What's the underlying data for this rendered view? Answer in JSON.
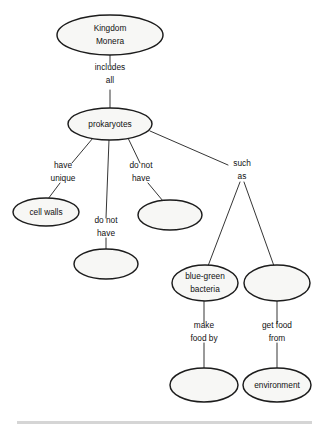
{
  "diagram": {
    "type": "concept-map",
    "background_color": "#ffffff",
    "node_fill_color": "#f7f7f5",
    "node_stroke_color": "#1c1c1c",
    "edge_color": "#2a2a2a",
    "nodes": [
      {
        "id": "kingdom-monera",
        "label": "Kingdom\nMonera",
        "line1": "Kingdom",
        "line2": "Monera",
        "blank": false,
        "cx": 110,
        "cy": 35,
        "rx": 53,
        "ry": 20
      },
      {
        "id": "prokaryotes",
        "label": "prokaryotes",
        "line1": "prokaryotes",
        "line2": "",
        "blank": false,
        "cx": 110,
        "cy": 124,
        "rx": 42,
        "ry": 16
      },
      {
        "id": "cell-walls",
        "label": "cell walls",
        "line1": "cell walls",
        "line2": "",
        "blank": false,
        "cx": 46,
        "cy": 212,
        "rx": 33,
        "ry": 14
      },
      {
        "id": "blank-do-not-have-1",
        "label": "",
        "line1": "",
        "line2": "",
        "blank": true,
        "cx": 170,
        "cy": 215,
        "rx": 32,
        "ry": 15
      },
      {
        "id": "blank-do-not-have-2",
        "label": "",
        "line1": "",
        "line2": "",
        "blank": true,
        "cx": 106,
        "cy": 264,
        "rx": 32,
        "ry": 15
      },
      {
        "id": "blue-green-bacteria",
        "label": "blue-green\nbacteria",
        "line1": "blue-green",
        "line2": "bacteria",
        "blank": false,
        "cx": 205,
        "cy": 283,
        "rx": 33,
        "ry": 18
      },
      {
        "id": "blank-such-as",
        "label": "",
        "line1": "",
        "line2": "",
        "blank": true,
        "cx": 277,
        "cy": 283,
        "rx": 33,
        "ry": 18
      },
      {
        "id": "blank-make-food-by",
        "label": "",
        "line1": "",
        "line2": "",
        "blank": true,
        "cx": 204,
        "cy": 385,
        "rx": 34,
        "ry": 17
      },
      {
        "id": "environment",
        "label": "environment",
        "line1": "environment",
        "line2": "",
        "blank": false,
        "cx": 277,
        "cy": 385,
        "rx": 34,
        "ry": 17
      }
    ],
    "link_labels": [
      {
        "id": "includes-all",
        "line1": "includes",
        "line2": "all",
        "x": 110,
        "y": 74
      },
      {
        "id": "have-unique",
        "line1": "have",
        "line2": "unique",
        "x": 63,
        "y": 172
      },
      {
        "id": "do-not-have-1",
        "line1": "do not",
        "line2": "have",
        "x": 141,
        "y": 172
      },
      {
        "id": "such-as",
        "line1": "such",
        "line2": "as",
        "x": 242,
        "y": 170
      },
      {
        "id": "do-not-have-2",
        "line1": "do not",
        "line2": "have",
        "x": 106,
        "y": 227
      },
      {
        "id": "make-food-by",
        "line1": "make",
        "line2": "food by",
        "x": 204,
        "y": 332
      },
      {
        "id": "get-food-from",
        "line1": "get food",
        "line2": "from",
        "x": 277,
        "y": 332
      }
    ],
    "edges": [
      {
        "id": "edge-monera-to-includes",
        "from": "kingdom-monera",
        "to": "includes-all",
        "x1": 110,
        "y1": 55,
        "x2": 110,
        "y2": 66
      },
      {
        "id": "edge-includes-to-prokaryotes",
        "from": "includes-all",
        "to": "prokaryotes",
        "x1": 110,
        "y1": 90,
        "x2": 110,
        "y2": 108
      },
      {
        "id": "edge-prokaryotes-to-have-unique",
        "from": "prokaryotes",
        "to": "have-unique",
        "x1": 93,
        "y1": 138,
        "x2": 72,
        "y2": 163
      },
      {
        "id": "edge-have-unique-to-cell-walls",
        "from": "have-unique",
        "to": "cell-walls",
        "x1": 60,
        "y1": 183,
        "x2": 48,
        "y2": 199
      },
      {
        "id": "edge-prokaryotes-to-do-not-have-2",
        "from": "prokaryotes",
        "to": "do-not-have-2",
        "x1": 109,
        "y1": 140,
        "x2": 106,
        "y2": 218
      },
      {
        "id": "edge-do-not-have-2-to-blank",
        "from": "do-not-have-2",
        "to": "blank-do-not-have-2",
        "x1": 106,
        "y1": 238,
        "x2": 106,
        "y2": 249
      },
      {
        "id": "edge-prokaryotes-to-do-not-have-1",
        "from": "prokaryotes",
        "to": "do-not-have-1",
        "x1": 128,
        "y1": 138,
        "x2": 140,
        "y2": 163
      },
      {
        "id": "edge-do-not-have-1-to-blank",
        "from": "do-not-have-1",
        "to": "blank-do-not-have-1",
        "x1": 148,
        "y1": 183,
        "x2": 163,
        "y2": 201
      },
      {
        "id": "edge-prokaryotes-to-such-as",
        "from": "prokaryotes",
        "to": "such-as",
        "x1": 150,
        "y1": 131,
        "x2": 228,
        "y2": 165
      },
      {
        "id": "edge-such-as-to-blue-green",
        "from": "such-as",
        "to": "blue-green-bacteria",
        "x1": 240,
        "y1": 182,
        "x2": 208,
        "y2": 266
      },
      {
        "id": "edge-such-as-to-blank",
        "from": "such-as",
        "to": "blank-such-as",
        "x1": 244,
        "y1": 182,
        "x2": 274,
        "y2": 266
      },
      {
        "id": "edge-blue-green-to-make-food",
        "from": "blue-green-bacteria",
        "to": "make-food-by",
        "x1": 204,
        "y1": 301,
        "x2": 204,
        "y2": 323
      },
      {
        "id": "edge-make-food-to-blank",
        "from": "make-food-by",
        "to": "blank-make-food-by",
        "x1": 204,
        "y1": 343,
        "x2": 204,
        "y2": 369
      },
      {
        "id": "edge-blank-such-as-to-get-food",
        "from": "blank-such-as",
        "to": "get-food-from",
        "x1": 277,
        "y1": 301,
        "x2": 277,
        "y2": 323
      },
      {
        "id": "edge-get-food-to-environment",
        "from": "get-food-from",
        "to": "environment",
        "x1": 277,
        "y1": 343,
        "x2": 277,
        "y2": 369
      }
    ]
  },
  "footer": {
    "caption": "",
    "rule_color": "#d5d5d5"
  }
}
